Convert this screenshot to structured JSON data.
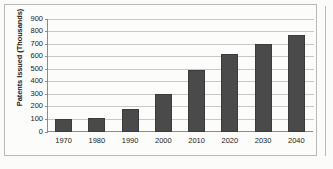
{
  "chart_data": {
    "type": "bar",
    "title": "",
    "xlabel": "",
    "ylabel": "Patents Issued (Thousands)",
    "categories": [
      "1970",
      "1980",
      "1990",
      "2000",
      "2010",
      "2020",
      "2030",
      "2040"
    ],
    "values": [
      100,
      110,
      185,
      305,
      490,
      620,
      700,
      770
    ],
    "series": [
      {
        "name": "Patents Issued",
        "values": [
          100,
          110,
          185,
          305,
          490,
          620,
          700,
          770
        ]
      }
    ],
    "ylim": [
      0,
      900
    ],
    "ytick_step": 100,
    "yticks": [
      0,
      100,
      200,
      300,
      400,
      500,
      600,
      700,
      800,
      900
    ],
    "ytick_labels": [
      "0",
      "100",
      "200",
      "300",
      "400",
      "500",
      "600",
      "700",
      "800",
      "900"
    ],
    "grid": "horizontal",
    "legend": "none",
    "bar_color": "#4a4a4a",
    "bar_edge_color": "#3b3b3b",
    "gridline_color": "#c8c8c8",
    "axis_color": "#8c8c8c",
    "frame_color": "#b9b9b9",
    "background_color": "#fcfcfb"
  }
}
